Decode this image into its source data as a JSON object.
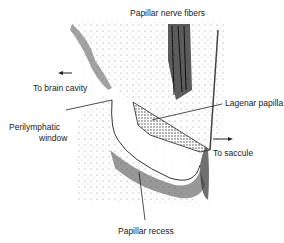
{
  "figure": {
    "type": "anatomical-illustration",
    "labels": {
      "top": "Papillar nerve fibers",
      "brain": "To brain cavity",
      "lagenar": "Lagenar papilla",
      "peri_line1": "Perilymphatic",
      "peri_line2": "window",
      "saccule": "To saccule",
      "recess": "Papillar recess"
    }
  }
}
